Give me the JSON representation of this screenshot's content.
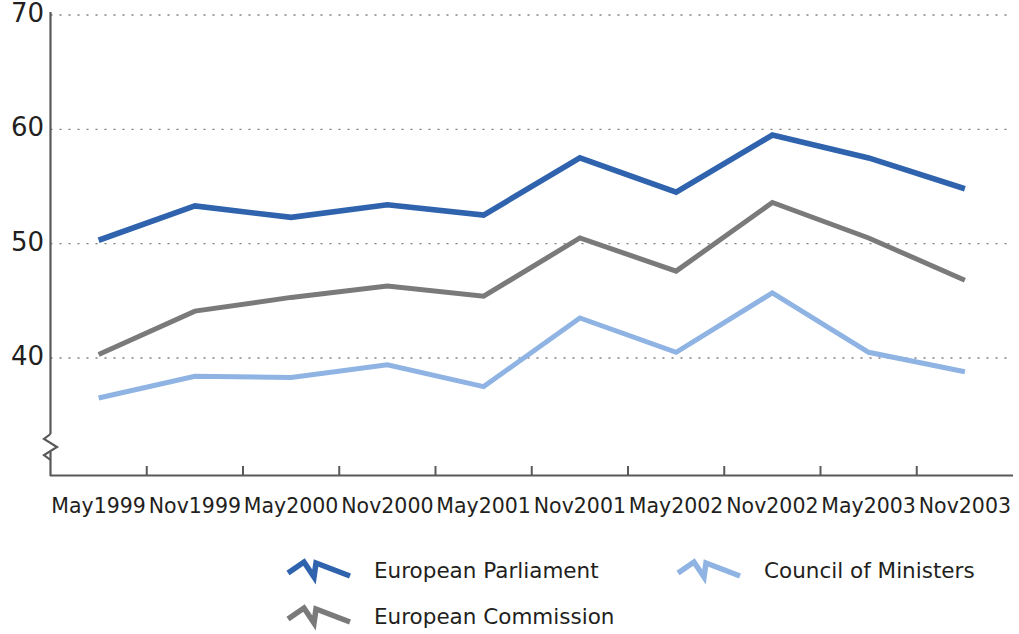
{
  "chart_data": {
    "type": "line",
    "title": "",
    "subtitle": "",
    "xlabel": "",
    "ylabel": "",
    "categories": [
      "May1999",
      "Nov1999",
      "May2000",
      "Nov2000",
      "May2001",
      "Nov2001",
      "May2002",
      "Nov2002",
      "May2003",
      "Nov2003"
    ],
    "ylim": [
      35,
      70
    ],
    "yticks": [
      40,
      50,
      60,
      70
    ],
    "ytick_labels": [
      "40",
      "50",
      "60",
      "70"
    ],
    "grid": "horizontal-dotted",
    "axis_break": true,
    "legend_position": "bottom",
    "series": [
      {
        "name": "European Parliament",
        "color": "#2f63ad",
        "values": [
          50.3,
          53.3,
          52.3,
          53.4,
          52.5,
          57.5,
          54.5,
          59.5,
          57.5,
          54.8
        ]
      },
      {
        "name": "European Commission",
        "color": "#7a7a7a",
        "values": [
          40.3,
          44.1,
          45.3,
          46.3,
          45.4,
          50.5,
          47.6,
          53.6,
          50.5,
          46.8
        ]
      },
      {
        "name": "Council of Ministers",
        "color": "#8fb4e3",
        "values": [
          36.5,
          38.4,
          38.3,
          39.4,
          37.5,
          43.5,
          40.5,
          45.7,
          40.5,
          38.8
        ]
      }
    ]
  },
  "axis": {
    "y_labels": [
      "70",
      "60",
      "50",
      "40"
    ],
    "x_labels": [
      "May1999",
      "Nov1999",
      "May2000",
      "Nov2000",
      "May2001",
      "Nov2001",
      "May2002",
      "Nov2002",
      "May2003",
      "Nov2003"
    ]
  },
  "legend": {
    "entries": [
      {
        "label": "European Parliament",
        "color": "#2f63ad"
      },
      {
        "label": "European Commission",
        "color": "#7a7a7a"
      },
      {
        "label": "Council of Ministers",
        "color": "#8fb4e3"
      }
    ]
  },
  "colors": {
    "parliament": "#2f63ad",
    "commission": "#7a7a7a",
    "council": "#8fb4e3",
    "axis": "#595959",
    "grid": "#808080",
    "text": "#231f20"
  }
}
